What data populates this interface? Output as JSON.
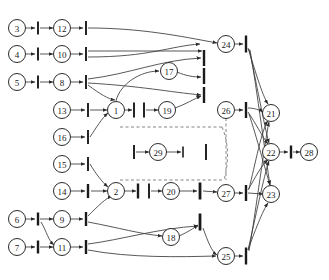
{
  "figure": {
    "kind": "petri-net-graph",
    "width": 329,
    "height": 280,
    "background": "#ffffff",
    "stroke_color": "#3a3a3a",
    "node_stroke": "#2b2b2b",
    "node_fill": "#ffffff",
    "dashed_color": "#6f6f6f",
    "corner_mark": ""
  },
  "places": [
    {
      "id": "p3",
      "label": "3",
      "x": 17,
      "y": 28,
      "r": 8.5
    },
    {
      "id": "p4",
      "label": "4",
      "x": 17,
      "y": 54,
      "r": 8.5
    },
    {
      "id": "p5",
      "label": "5",
      "x": 17,
      "y": 82,
      "r": 8.5
    },
    {
      "id": "p6",
      "label": "6",
      "x": 17,
      "y": 219,
      "r": 8.5
    },
    {
      "id": "p7",
      "label": "7",
      "x": 17,
      "y": 247,
      "r": 8.5
    },
    {
      "id": "p12",
      "label": "12",
      "x": 62,
      "y": 28,
      "r": 8.5
    },
    {
      "id": "p10",
      "label": "10",
      "x": 62,
      "y": 54,
      "r": 8.5
    },
    {
      "id": "p8",
      "label": "8",
      "x": 62,
      "y": 82,
      "r": 8.5
    },
    {
      "id": "p13",
      "label": "13",
      "x": 62,
      "y": 110,
      "r": 8.5
    },
    {
      "id": "p16",
      "label": "16",
      "x": 62,
      "y": 137,
      "r": 8.5
    },
    {
      "id": "p15",
      "label": "15",
      "x": 62,
      "y": 164,
      "r": 8.5
    },
    {
      "id": "p14",
      "label": "14",
      "x": 62,
      "y": 191,
      "r": 8.5
    },
    {
      "id": "p9",
      "label": "9",
      "x": 62,
      "y": 219,
      "r": 8.5
    },
    {
      "id": "p11",
      "label": "11",
      "x": 62,
      "y": 247,
      "r": 8.5
    },
    {
      "id": "p1",
      "label": "1",
      "x": 116,
      "y": 110,
      "r": 8.5
    },
    {
      "id": "p2",
      "label": "2",
      "x": 116,
      "y": 191,
      "r": 8.5
    },
    {
      "id": "p17",
      "label": "17",
      "x": 169,
      "y": 71,
      "r": 8.5
    },
    {
      "id": "p19",
      "label": "19",
      "x": 167,
      "y": 110,
      "r": 8.5
    },
    {
      "id": "p29",
      "label": "29",
      "x": 158,
      "y": 152,
      "r": 8.5
    },
    {
      "id": "p20",
      "label": "20",
      "x": 171,
      "y": 191,
      "r": 8.5
    },
    {
      "id": "p18",
      "label": "18",
      "x": 171,
      "y": 237,
      "r": 8.5
    },
    {
      "id": "p24",
      "label": "24",
      "x": 226,
      "y": 44,
      "r": 8.5
    },
    {
      "id": "p26",
      "label": "26",
      "x": 226,
      "y": 110,
      "r": 8.5
    },
    {
      "id": "p27",
      "label": "27",
      "x": 226,
      "y": 193,
      "r": 8.5
    },
    {
      "id": "p25",
      "label": "25",
      "x": 226,
      "y": 256,
      "r": 8.5
    },
    {
      "id": "p21",
      "label": "21",
      "x": 271,
      "y": 113,
      "r": 8.5
    },
    {
      "id": "p22",
      "label": "22",
      "x": 271,
      "y": 152,
      "r": 8.5
    },
    {
      "id": "p23",
      "label": "23",
      "x": 271,
      "y": 194,
      "r": 8.5
    },
    {
      "id": "p28",
      "label": "28",
      "x": 309,
      "y": 152,
      "r": 8.5
    }
  ],
  "transitions": [
    {
      "id": "t1",
      "x": 38,
      "y": 28,
      "h": 13,
      "w": 1.9
    },
    {
      "id": "t2",
      "x": 38,
      "y": 54,
      "h": 13,
      "w": 1.9
    },
    {
      "id": "t3",
      "x": 38,
      "y": 82,
      "h": 13,
      "w": 1.9
    },
    {
      "id": "t4",
      "x": 38,
      "y": 219,
      "h": 13,
      "w": 2.4
    },
    {
      "id": "t5",
      "x": 38,
      "y": 247,
      "h": 13,
      "w": 2.4
    },
    {
      "id": "t6",
      "x": 86,
      "y": 28,
      "h": 14,
      "w": 1.9
    },
    {
      "id": "t7",
      "x": 86,
      "y": 54,
      "h": 14,
      "w": 1.9
    },
    {
      "id": "t8",
      "x": 86,
      "y": 82,
      "h": 14,
      "w": 1.9
    },
    {
      "id": "t9",
      "x": 88,
      "y": 110,
      "h": 14,
      "w": 1.9
    },
    {
      "id": "t10",
      "x": 88,
      "y": 137,
      "h": 14,
      "w": 1.9
    },
    {
      "id": "t11",
      "x": 88,
      "y": 164,
      "h": 14,
      "w": 1.9
    },
    {
      "id": "t12",
      "x": 88,
      "y": 191,
      "h": 14,
      "w": 2.4
    },
    {
      "id": "t13",
      "x": 86,
      "y": 219,
      "h": 14,
      "w": 2.4
    },
    {
      "id": "t14",
      "x": 86,
      "y": 247,
      "h": 14,
      "w": 2.4
    },
    {
      "id": "t15",
      "x": 134,
      "y": 110,
      "h": 15,
      "w": 1.9
    },
    {
      "id": "t16",
      "x": 144,
      "y": 110,
      "h": 15,
      "w": 1.9
    },
    {
      "id": "t17",
      "x": 134,
      "y": 152,
      "h": 14,
      "w": 1.9
    },
    {
      "id": "t18",
      "x": 138,
      "y": 191,
      "h": 15,
      "w": 2.4
    },
    {
      "id": "t19",
      "x": 149,
      "y": 191,
      "h": 15,
      "w": 1.9
    },
    {
      "id": "t20",
      "x": 204,
      "y": 58,
      "h": 16,
      "w": 2.4
    },
    {
      "id": "t21",
      "x": 204,
      "y": 76,
      "h": 16,
      "w": 2.4
    },
    {
      "id": "t22",
      "x": 204,
      "y": 95,
      "h": 16,
      "w": 2.4
    },
    {
      "id": "t23",
      "x": 206,
      "y": 152,
      "h": 16,
      "w": 1.9
    },
    {
      "id": "t24",
      "x": 200,
      "y": 191,
      "h": 17,
      "w": 2.8
    },
    {
      "id": "t25",
      "x": 200,
      "y": 222,
      "h": 17,
      "w": 2.8
    },
    {
      "id": "t26",
      "x": 246,
      "y": 44,
      "h": 17,
      "w": 2.4
    },
    {
      "id": "t27",
      "x": 246,
      "y": 110,
      "h": 16,
      "w": 2.4
    },
    {
      "id": "t28",
      "x": 246,
      "y": 193,
      "h": 16,
      "w": 2.4
    },
    {
      "id": "t29",
      "x": 246,
      "y": 256,
      "h": 17,
      "w": 2.4
    },
    {
      "id": "t30",
      "x": 291,
      "y": 152,
      "h": 13,
      "w": 2.4
    },
    {
      "id": "t31",
      "x": 183,
      "y": 152,
      "h": 11,
      "w": 1.6
    }
  ],
  "arcs": [
    {
      "from": "p3",
      "to": "t1",
      "d": "M25.5,28 L35,28"
    },
    {
      "from": "t1",
      "to": "p12",
      "d": "M40,28 L53,28"
    },
    {
      "from": "p12",
      "to": "t6",
      "d": "M70.5,28 L83,28"
    },
    {
      "from": "t6",
      "to": "p24",
      "d": "M88,28 C140,28 180,36 217,43"
    },
    {
      "from": "p4",
      "to": "t2",
      "d": "M25.5,54 L35,54"
    },
    {
      "from": "t2",
      "to": "p10",
      "d": "M40,54 L53,54"
    },
    {
      "from": "p10",
      "to": "t7",
      "d": "M70.5,54 L83,54"
    },
    {
      "from": "t7",
      "to": "x1",
      "d": "M88,51 L202,51"
    },
    {
      "from": "t7",
      "to": "x2",
      "d": "M88,57 C150,57 170,46 200,44"
    },
    {
      "from": "p5",
      "to": "t3",
      "d": "M25.5,82 L35,82"
    },
    {
      "from": "t3",
      "to": "p8",
      "d": "M40,82 L53,82"
    },
    {
      "from": "p8",
      "to": "t8",
      "d": "M70.5,82 L83,82"
    },
    {
      "from": "t8",
      "to": "p1",
      "d": "M88,85 C100,94 108,99 115,100"
    },
    {
      "from": "t8",
      "to": "t20",
      "d": "M88,79 C130,74 160,60 201,58"
    },
    {
      "from": "t8",
      "to": "t22",
      "d": "M88,83 C140,86 170,92 201,95"
    },
    {
      "from": "p13",
      "to": "t9",
      "d": "M70.5,110 L85,110"
    },
    {
      "from": "t9",
      "to": "p1",
      "d": "M90,110 L107,110"
    },
    {
      "from": "p16",
      "to": "t10",
      "d": "M70.5,137 L85,137"
    },
    {
      "from": "t10",
      "to": "p1",
      "d": "M90,137 C96,128 102,118 108,113"
    },
    {
      "from": "p15",
      "to": "t11",
      "d": "M70.5,164 L85,164"
    },
    {
      "from": "t11",
      "to": "p2",
      "d": "M90,164 C96,174 102,182 108,187"
    },
    {
      "from": "p14",
      "to": "t12",
      "d": "M70.5,191 L85,191"
    },
    {
      "from": "t12",
      "to": "p2",
      "d": "M91,191 L107,191"
    },
    {
      "from": "p6",
      "to": "t13",
      "d": "M25.5,219 L35,219"
    },
    {
      "from": "t13",
      "to": "p9",
      "d": "M40,219 L53,219"
    },
    {
      "from": "t13",
      "to": "p11",
      "d": "M41,222 C47,232 48,240 54,245"
    },
    {
      "from": "p9",
      "to": "t13b",
      "d": "M70.5,219 L83,219"
    },
    {
      "from": "t13b",
      "to": "p2",
      "d": "M88,216 C98,206 106,198 112,196"
    },
    {
      "from": "t13b",
      "to": "p18",
      "d": "M88,222 C120,228 140,234 162,236"
    },
    {
      "from": "p7",
      "to": "t5",
      "d": "M25.5,247 L35,247"
    },
    {
      "from": "t5",
      "to": "p11",
      "d": "M40,247 L53,247"
    },
    {
      "from": "p11",
      "to": "t14",
      "d": "M70.5,247 L83,247"
    },
    {
      "from": "t14",
      "to": "p25",
      "d": "M88,250 C130,258 180,257 216,256"
    },
    {
      "from": "t14",
      "to": "t24",
      "d": "M88,244 C120,240 160,228 198,226"
    },
    {
      "from": "p1",
      "to": "t15",
      "d": "M124.5,110 L132,110"
    },
    {
      "from": "t16",
      "to": "p19",
      "d": "M146,110 L158,110"
    },
    {
      "from": "p19",
      "to": "t22",
      "d": "M175,108 C186,104 194,99 201,96"
    },
    {
      "from": "p17",
      "to": "t21",
      "d": "M177,72 C186,76 194,77 201,77"
    },
    {
      "from": "p1",
      "to": "p17",
      "d": "M116,101 C120,84 140,71 159,71"
    },
    {
      "from": "t17",
      "to": "p29",
      "d": "M136,152 L149,152"
    },
    {
      "from": "p29",
      "to": "t31",
      "d": "M166,152 L181,152"
    },
    {
      "from": "p2",
      "to": "t18",
      "d": "M124.5,191 L136,191"
    },
    {
      "from": "t19",
      "to": "p20",
      "d": "M151,191 L162,191"
    },
    {
      "from": "p20",
      "to": "t24",
      "d": "M179,191 L197,191"
    },
    {
      "from": "p18",
      "to": "t25",
      "d": "M179,236 C188,232 194,228 198,225"
    },
    {
      "from": "t24",
      "to": "p27",
      "d": "M203,191 L217,192"
    },
    {
      "from": "t25",
      "to": "p25",
      "d": "M203,228 C208,242 212,252 217,255"
    },
    {
      "from": "p24",
      "to": "t26",
      "d": "M234.5,44 L243,44"
    },
    {
      "from": "p26",
      "to": "t27",
      "d": "M234.5,110 L243,110"
    },
    {
      "from": "p27",
      "to": "t28",
      "d": "M234.5,193 L243,193"
    },
    {
      "from": "p25",
      "to": "t29",
      "d": "M234.5,256 L243,256"
    },
    {
      "from": "t26",
      "to": "p21",
      "d": "M248,48 C255,70 262,95 268,104"
    },
    {
      "from": "t26",
      "to": "p22",
      "d": "M249,49 C256,80 264,125 269,143"
    },
    {
      "from": "t26",
      "to": "p23",
      "d": "M250,50 C257,90 266,160 270,185"
    },
    {
      "from": "t27",
      "to": "p21",
      "d": "M248,108 C254,108 260,110 263,112"
    },
    {
      "from": "t27",
      "to": "p22",
      "d": "M248,112 C255,122 263,138 268,144"
    },
    {
      "from": "t27",
      "to": "p23",
      "d": "M249,114 C256,135 266,172 270,185"
    },
    {
      "from": "t28",
      "to": "p21",
      "d": "M249,189 C255,165 262,128 268,121"
    },
    {
      "from": "t28",
      "to": "p22",
      "d": "M248,190 C255,178 262,164 268,160"
    },
    {
      "from": "t28",
      "to": "p23",
      "d": "M248,193 L263,194"
    },
    {
      "from": "t29",
      "to": "p21",
      "d": "M249,251 C256,210 265,140 269,122"
    },
    {
      "from": "t29",
      "to": "p22",
      "d": "M248,250 C255,220 264,175 269,161"
    },
    {
      "from": "t29",
      "to": "p23",
      "d": "M248,250 C254,233 263,210 268,203"
    },
    {
      "from": "p22",
      "to": "t30",
      "d": "M279.5,152 L288,152"
    },
    {
      "from": "t30",
      "to": "p28",
      "d": "M293,152 L300,152"
    }
  ],
  "dashed_arcs": [
    {
      "id": "d1",
      "d": "M120,127 L222,127"
    },
    {
      "id": "d2",
      "d": "M120,180 L222,180"
    },
    {
      "id": "d3",
      "d": "M222,127 C230,145 228,166 224,180"
    },
    {
      "id": "d4",
      "d": "M226,118 L226,180"
    }
  ]
}
